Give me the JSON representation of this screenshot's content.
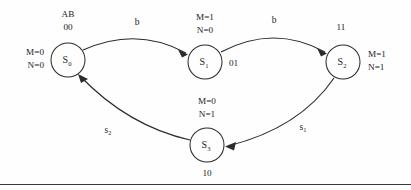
{
  "diagram": {
    "type": "state-transition-diagram",
    "input_header": "AB",
    "states": [
      {
        "id": "s0",
        "label": "S",
        "sub": "0",
        "cx": 68,
        "cy": 60,
        "r": 17,
        "code_above": "00",
        "header_above": "AB",
        "outputs_left": [
          "M=0",
          "N=0"
        ]
      },
      {
        "id": "s1",
        "label": "S",
        "sub": "1",
        "cx": 205,
        "cy": 62,
        "r": 17,
        "code_right": "01",
        "outputs_above": [
          "M=1",
          "N=0"
        ]
      },
      {
        "id": "s2",
        "label": "S",
        "sub": "2",
        "cx": 343,
        "cy": 62,
        "r": 17,
        "code_above": "11",
        "outputs_right": [
          "M=1",
          "N=1"
        ]
      },
      {
        "id": "s3",
        "label": "S",
        "sub": "3",
        "cx": 207,
        "cy": 145,
        "r": 17,
        "code_below": "10",
        "outputs_above": [
          "M=0",
          "N=1"
        ]
      }
    ],
    "transitions": [
      {
        "id": "t-s0-s1",
        "from": "s0",
        "to": "s1",
        "label": "b",
        "label_sub": "",
        "label_x": 137,
        "label_y": 22
      },
      {
        "id": "t-s1-s2",
        "from": "s1",
        "to": "s2",
        "label": "b",
        "label_sub": "",
        "label_x": 272,
        "label_y": 20
      },
      {
        "id": "t-s2-s3",
        "from": "s2",
        "to": "s3",
        "label": "s",
        "label_sub": "1",
        "label_x": 303,
        "label_y": 127
      },
      {
        "id": "t-s3-s0",
        "from": "s3",
        "to": "s0",
        "label": "s",
        "label_sub": "2",
        "label_x": 108,
        "label_y": 130
      }
    ],
    "colors": {
      "stroke": "#2b2b2b",
      "text": "#1c1c1c",
      "background": "#fefefe"
    }
  }
}
